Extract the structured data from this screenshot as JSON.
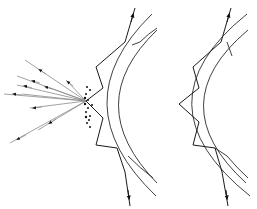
{
  "figure": {
    "panels": [
      {
        "id": "left",
        "description": "Light ray propagating by internal reflection in a curved shell; scattering at leftmost reflection point",
        "has_scattering": true,
        "scatter_ray_count": 10,
        "scatter_dot_count": 14
      },
      {
        "id": "right",
        "description": "Light ray propagating by internal reflection in a curved shell without scattering",
        "has_scattering": false
      }
    ],
    "colors": {
      "line": "#1a1a1a",
      "scatter_line": "#8a8a8a",
      "background": "#ffffff"
    }
  }
}
